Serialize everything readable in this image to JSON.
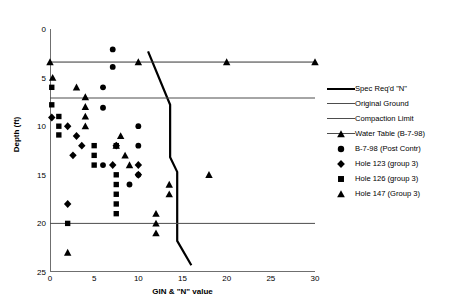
{
  "chart_data": {
    "type": "scatter",
    "title": "",
    "xlabel": "GIN & \"N\" value",
    "ylabel": "Depth (ft)",
    "xlim": [
      0,
      30
    ],
    "ylim": [
      0,
      25
    ],
    "y_inverted": true,
    "grid": false,
    "xticks": [
      0,
      5,
      10,
      15,
      20,
      25,
      30
    ],
    "yticks": [
      0,
      5,
      10,
      15,
      20,
      25
    ],
    "legend_position": "right",
    "series": [
      {
        "name": "Spec Req'd \"N\"",
        "type": "line",
        "style": "thick-black",
        "marker": "none",
        "points": [
          {
            "x": 11.1,
            "y": 2.3
          },
          {
            "x": 13.6,
            "y": 7.8
          },
          {
            "x": 13.6,
            "y": 13.2
          },
          {
            "x": 14.4,
            "y": 14.7
          },
          {
            "x": 14.4,
            "y": 21.8
          },
          {
            "x": 16.0,
            "y": 24.3
          }
        ]
      },
      {
        "name": "Original Ground",
        "type": "hline",
        "style": "thin-gray",
        "marker": "none",
        "points": [
          {
            "x": 0,
            "y": 7.1
          },
          {
            "x": 30,
            "y": 7.1
          }
        ]
      },
      {
        "name": "Compaction Limit",
        "type": "hline",
        "style": "thin-gray",
        "marker": "none",
        "points": [
          {
            "x": 0,
            "y": 20.0
          },
          {
            "x": 30,
            "y": 20.0
          }
        ]
      },
      {
        "name": "Water Table (B-7-98)",
        "type": "line-marker",
        "style": "thin-black",
        "marker": "triangle",
        "points": [
          {
            "x": 0,
            "y": 3.4
          },
          {
            "x": 10,
            "y": 3.4
          },
          {
            "x": 20,
            "y": 3.4
          },
          {
            "x": 30,
            "y": 3.4
          }
        ]
      },
      {
        "name": "B-7-98 (Post Contr)",
        "type": "scatter",
        "marker": "circle",
        "points": [
          {
            "x": 7.1,
            "y": 2.1
          },
          {
            "x": 7.1,
            "y": 3.9
          },
          {
            "x": 6.0,
            "y": 6.0
          },
          {
            "x": 6.0,
            "y": 8.1
          },
          {
            "x": 10.0,
            "y": 10.0
          },
          {
            "x": 10.0,
            "y": 12.0
          },
          {
            "x": 6.0,
            "y": 14.0
          },
          {
            "x": 10.0,
            "y": 15.0
          },
          {
            "x": 9.0,
            "y": 16.0
          }
        ]
      },
      {
        "name": "Hole 123 (group 3)",
        "type": "scatter",
        "marker": "diamond",
        "points": [
          {
            "x": 0.2,
            "y": 9.1
          },
          {
            "x": 2.0,
            "y": 10.0
          },
          {
            "x": 3.0,
            "y": 11.0
          },
          {
            "x": 3.6,
            "y": 12.0
          },
          {
            "x": 2.6,
            "y": 13.0
          },
          {
            "x": 7.1,
            "y": 14.0
          },
          {
            "x": 7.5,
            "y": 12.0
          },
          {
            "x": 10.0,
            "y": 14.0
          },
          {
            "x": 10.0,
            "y": 15.0
          },
          {
            "x": 2.0,
            "y": 18.0
          }
        ]
      },
      {
        "name": "Hole 126 (group 3)",
        "type": "scatter",
        "marker": "square",
        "points": [
          {
            "x": 0.2,
            "y": 6.0
          },
          {
            "x": 0.2,
            "y": 7.8
          },
          {
            "x": 1.0,
            "y": 9.0
          },
          {
            "x": 1.0,
            "y": 10.0
          },
          {
            "x": 1.0,
            "y": 10.9
          },
          {
            "x": 5.0,
            "y": 12.0
          },
          {
            "x": 5.0,
            "y": 13.0
          },
          {
            "x": 5.0,
            "y": 14.0
          },
          {
            "x": 7.5,
            "y": 12.0
          },
          {
            "x": 7.5,
            "y": 15.0
          },
          {
            "x": 7.5,
            "y": 16.0
          },
          {
            "x": 7.5,
            "y": 17.0
          },
          {
            "x": 7.5,
            "y": 18.0
          },
          {
            "x": 7.5,
            "y": 19.0
          },
          {
            "x": 2.0,
            "y": 20.0
          }
        ]
      },
      {
        "name": "Hole 147 (Group 3)",
        "type": "scatter",
        "marker": "triangle",
        "points": [
          {
            "x": 0.3,
            "y": 5.0
          },
          {
            "x": 3.0,
            "y": 6.0
          },
          {
            "x": 4.0,
            "y": 7.0
          },
          {
            "x": 4.0,
            "y": 8.0
          },
          {
            "x": 4.0,
            "y": 9.0
          },
          {
            "x": 4.0,
            "y": 10.0
          },
          {
            "x": 8.0,
            "y": 11.0
          },
          {
            "x": 7.5,
            "y": 12.0
          },
          {
            "x": 8.5,
            "y": 13.0
          },
          {
            "x": 9.0,
            "y": 14.0
          },
          {
            "x": 18.0,
            "y": 15.0
          },
          {
            "x": 13.5,
            "y": 16.0
          },
          {
            "x": 13.5,
            "y": 17.0
          },
          {
            "x": 12.0,
            "y": 19.0
          },
          {
            "x": 12.0,
            "y": 20.0
          },
          {
            "x": 12.0,
            "y": 21.0
          },
          {
            "x": 2.0,
            "y": 23.0
          }
        ]
      }
    ]
  },
  "axes": {
    "ylabel": "Depth (ft)",
    "xlabel": "GIN & \"N\" value",
    "yticks": [
      "0",
      "5",
      "10",
      "15",
      "20",
      "25"
    ],
    "xticks": [
      "0",
      "5",
      "10",
      "15",
      "20",
      "25",
      "30"
    ]
  },
  "legend": {
    "items": [
      {
        "label": "Spec Req'd \"N\"",
        "key": "thick-line",
        "icon": "line-icon"
      },
      {
        "label": "Original Ground",
        "key": "thin-line",
        "icon": "line-icon"
      },
      {
        "label": "Compaction Limit",
        "key": "thin-line",
        "icon": "line-icon"
      },
      {
        "label": "Water Table (B-7-98)",
        "key": "line-triangle",
        "icon": "triangle-icon"
      },
      {
        "label": "B-7-98 (Post Contr)",
        "key": "circle",
        "icon": "circle-icon"
      },
      {
        "label": "Hole 123 (group 3)",
        "key": "diamond",
        "icon": "diamond-icon"
      },
      {
        "label": "Hole 126 (group 3)",
        "key": "square",
        "icon": "square-icon"
      },
      {
        "label": "Hole 147 (Group 3)",
        "key": "triangle",
        "icon": "triangle-icon"
      }
    ]
  },
  "colors": {
    "marker": "#000000",
    "axis": "#6f6f6f",
    "gridline": "#4d4d4d",
    "background": "#ffffff"
  }
}
